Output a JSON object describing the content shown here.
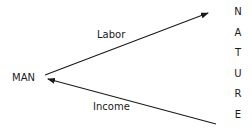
{
  "diagram": {
    "nodes": {
      "man": "MAN",
      "nature_letters": [
        "N",
        "A",
        "T",
        "U",
        "R",
        "E"
      ]
    },
    "edges": [
      {
        "from": "MAN",
        "to": "NATURE",
        "label": "Labor"
      },
      {
        "from": "NATURE",
        "to": "MAN",
        "label": "Income"
      }
    ],
    "colors": {
      "line": "#1a1a1a",
      "text": "#1a1a1a"
    }
  }
}
